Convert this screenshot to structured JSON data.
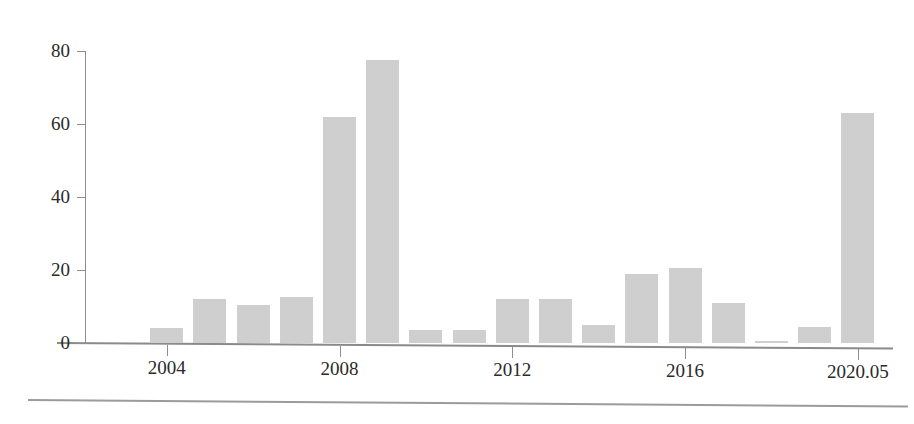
{
  "chart_data": {
    "type": "bar",
    "title": "",
    "subtitle": "",
    "xlabel": "",
    "ylabel": "",
    "grid": false,
    "legend": null,
    "ylim": [
      0,
      80
    ],
    "y_ticks": [
      0,
      20,
      40,
      60,
      80
    ],
    "y_tick_labels": [
      "0",
      "20",
      "40",
      "60",
      "80"
    ],
    "x_tick_labels": [
      "2004",
      "2008",
      "2012",
      "2016",
      "2020.05"
    ],
    "x_tick_categories": [
      "2004",
      "2008",
      "2012",
      "2016",
      "2020.05"
    ],
    "categories": [
      "2003",
      "2004",
      "2005",
      "2006",
      "2007",
      "2008",
      "2009",
      "2010",
      "2011",
      "2012",
      "2013",
      "2014",
      "2015",
      "2016",
      "2017",
      "2018",
      "2019",
      "2020.05"
    ],
    "values": [
      0,
      4,
      12,
      10.5,
      12.5,
      62,
      77.5,
      3.5,
      3.5,
      12,
      12,
      5,
      18.8,
      20.5,
      11,
      0.6,
      4.5,
      63
    ],
    "bar_color": "#cfcfcf",
    "axis_color": "#8e8e8e",
    "text_color": "#2a2a2a",
    "background_color": "#ffffff"
  },
  "axes": {
    "y_ticks": [
      {
        "label": "0",
        "value": 0
      },
      {
        "label": "20",
        "value": 20
      },
      {
        "label": "40",
        "value": 40
      },
      {
        "label": "60",
        "value": 60
      },
      {
        "label": "80",
        "value": 80
      }
    ],
    "x_ticks": [
      {
        "label": "2004",
        "index": 1
      },
      {
        "label": "2008",
        "index": 5
      },
      {
        "label": "2012",
        "index": 9
      },
      {
        "label": "2016",
        "index": 13
      },
      {
        "label": "2020.05",
        "index": 17
      }
    ]
  }
}
